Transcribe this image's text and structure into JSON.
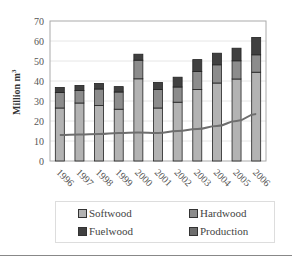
{
  "chart_data": {
    "type": "bar",
    "stacked": true,
    "title": "",
    "xlabel": "",
    "ylabel": "Million m³",
    "ylim": [
      0,
      70
    ],
    "yticks": [
      0,
      10,
      20,
      30,
      40,
      50,
      60,
      70
    ],
    "categories": [
      "1996",
      "1997",
      "1998",
      "1999",
      "2000",
      "2001",
      "2002",
      "2003",
      "2004",
      "2005",
      "2006"
    ],
    "series": [
      {
        "name": "Softwood",
        "kind": "bar",
        "color": "#b3b3b3",
        "values": [
          26.5,
          29,
          27.7,
          25.9,
          41.1,
          26.5,
          29.4,
          35.7,
          39,
          41,
          44.4
        ]
      },
      {
        "name": "Hardwood",
        "kind": "bar",
        "color": "#8c8c8c",
        "values": [
          7.8,
          6.2,
          8.3,
          8.6,
          9.3,
          9.3,
          7.6,
          9.1,
          9.1,
          9.1,
          8.7
        ]
      },
      {
        "name": "Fuelwood",
        "kind": "bar",
        "color": "#404040",
        "values": [
          2.5,
          2.6,
          2.8,
          2.7,
          3,
          3.5,
          4.9,
          5.9,
          5.8,
          6.3,
          8.7
        ]
      },
      {
        "name": "Production",
        "kind": "line",
        "color": "#6e6e6e",
        "values": [
          13,
          13.3,
          13.5,
          14,
          14.2,
          14,
          15,
          16,
          17.5,
          20,
          23.5
        ]
      }
    ],
    "legend_position": "bottom",
    "grid": true
  },
  "legend": {
    "items": [
      {
        "label": "Softwood",
        "color": "#b3b3b3"
      },
      {
        "label": "Hardwood",
        "color": "#8c8c8c"
      },
      {
        "label": "Fuelwood",
        "color": "#404040"
      },
      {
        "label": "Production",
        "color": "#6e6e6e"
      }
    ]
  },
  "axis": {
    "ylabel": "Million m",
    "ylabel_sup": "3"
  }
}
